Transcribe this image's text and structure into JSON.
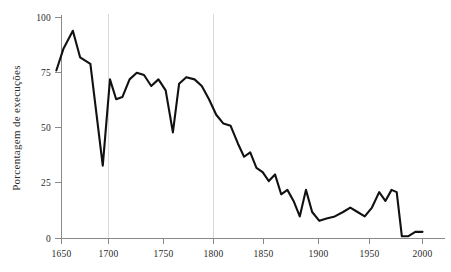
{
  "chart_data": {
    "type": "line",
    "title": "",
    "subtitle": "",
    "xlabel": "",
    "ylabel": "Porcentagem de execuções",
    "xlim": [
      1640,
      2005
    ],
    "ylim": [
      0,
      100
    ],
    "grid": "vertical gridlines at 1700 and 1800 only",
    "legend": "none",
    "xticks": [
      1650,
      1700,
      1750,
      1800,
      1850,
      1900,
      1950,
      2000
    ],
    "xticklabels": [
      "1650",
      "1700",
      "1750",
      "1800",
      "1850",
      "1900",
      "1950",
      "2000"
    ],
    "yticks": [
      0,
      25,
      50,
      75,
      100
    ],
    "yticklabels": [
      "0",
      "25",
      "50",
      "75",
      "100"
    ],
    "gridlines_x": [
      1700,
      1800
    ],
    "line_color": "#111111",
    "axis_color": "#8a8a8a",
    "gridline_color": "#d9d9d6",
    "series": [
      {
        "name": "Porcentagem de execuções",
        "x": [
          1645,
          1652,
          1661,
          1668,
          1678,
          1690,
          1697,
          1703,
          1709,
          1716,
          1723,
          1730,
          1737,
          1744,
          1751,
          1758,
          1764,
          1771,
          1779,
          1786,
          1793,
          1800,
          1807,
          1814,
          1821,
          1827,
          1833,
          1839,
          1845,
          1851,
          1857,
          1863,
          1869,
          1875,
          1881,
          1887,
          1893,
          1900,
          1907,
          1915,
          1923,
          1930,
          1937,
          1944,
          1951,
          1958,
          1964,
          1970,
          1975,
          1980,
          1986,
          1993,
          2000
        ],
        "y": [
          76,
          86,
          94,
          82,
          79,
          33,
          72,
          63,
          64,
          72,
          75,
          74,
          69,
          72,
          67,
          48,
          70,
          73,
          72,
          69,
          63,
          56,
          52,
          51,
          43,
          37,
          39,
          32,
          30,
          26,
          29,
          20,
          22,
          17,
          10,
          22,
          12,
          8,
          9,
          10,
          12,
          14,
          12,
          10,
          14,
          21,
          17,
          22,
          21,
          1,
          1,
          3,
          3
        ]
      }
    ]
  },
  "axis": {
    "ylabel": "Porcentagem de execuções",
    "ytick_0": "0",
    "ytick_25": "25",
    "ytick_50": "50",
    "ytick_75": "75",
    "ytick_100": "100",
    "xtick_1650": "1650",
    "xtick_1700": "1700",
    "xtick_1750": "1750",
    "xtick_1800": "1800",
    "xtick_1850": "1850",
    "xtick_1900": "1900",
    "xtick_1950": "1950",
    "xtick_2000": "2000"
  }
}
